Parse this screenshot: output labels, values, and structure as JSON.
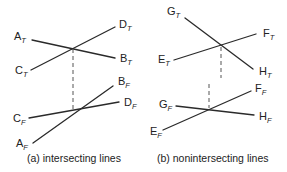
{
  "panels": [
    {
      "id": "a",
      "caption": "(a) intersecting lines",
      "top_view": {
        "lines": [
          {
            "from": {
              "name": "A",
              "sub": "T",
              "x": 32,
              "y": 40
            },
            "to": {
              "name": "B",
              "sub": "T",
              "x": 115,
              "y": 58
            }
          },
          {
            "from": {
              "name": "C",
              "sub": "T",
              "x": 31,
              "y": 70
            },
            "to": {
              "name": "D",
              "sub": "T",
              "x": 115,
              "y": 27
            }
          }
        ],
        "intersection": {
          "x": 73,
          "y": 48
        }
      },
      "front_view": {
        "lines": [
          {
            "from": {
              "name": "A",
              "sub": "F",
              "x": 33,
              "y": 143
            },
            "to": {
              "name": "B",
              "sub": "F",
              "x": 113,
              "y": 86
            }
          },
          {
            "from": {
              "name": "C",
              "sub": "F",
              "x": 29,
              "y": 118
            },
            "to": {
              "name": "D",
              "sub": "F",
              "x": 119,
              "y": 102
            }
          }
        ],
        "intersection": {
          "x": 73,
          "y": 110
        }
      },
      "projection_lines": [
        {
          "x1": 73,
          "y1": 49,
          "x2": 73,
          "y2": 109
        }
      ]
    },
    {
      "id": "b",
      "caption": "(b) nonintersecting lines",
      "top_view": {
        "lines": [
          {
            "from": {
              "name": "G",
              "sub": "T",
              "x": 185,
              "y": 18
            },
            "to": {
              "name": "H",
              "sub": "T",
              "x": 253,
              "y": 69
            }
          },
          {
            "from": {
              "name": "E",
              "sub": "T",
              "x": 174,
              "y": 60
            },
            "to": {
              "name": "F",
              "sub": "T",
              "x": 256,
              "y": 34
            }
          }
        ],
        "crossing": {
          "x": 221,
          "y": 46
        }
      },
      "front_view": {
        "lines": [
          {
            "from": {
              "name": "G",
              "sub": "F",
              "x": 176,
              "y": 106
            },
            "to": {
              "name": "H",
              "sub": "F",
              "x": 254,
              "y": 115
            }
          },
          {
            "from": {
              "name": "E",
              "sub": "F",
              "x": 163,
              "y": 130
            },
            "to": {
              "name": "F",
              "sub": "F",
              "x": 251,
              "y": 91
            }
          }
        ],
        "crossing": {
          "x": 210,
          "y": 109
        }
      },
      "projection_lines": [
        {
          "x1": 221,
          "y1": 47,
          "x2": 221,
          "y2": 78
        },
        {
          "x1": 209,
          "y1": 84,
          "x2": 209,
          "y2": 108
        }
      ]
    }
  ],
  "labels": {
    "AT": {
      "main": "A",
      "sub": "T"
    },
    "BT": {
      "main": "B",
      "sub": "T"
    },
    "CT": {
      "main": "C",
      "sub": "T"
    },
    "DT": {
      "main": "D",
      "sub": "T"
    },
    "AF": {
      "main": "A",
      "sub": "F"
    },
    "BF": {
      "main": "B",
      "sub": "F"
    },
    "CF": {
      "main": "C",
      "sub": "F"
    },
    "DF": {
      "main": "D",
      "sub": "F"
    },
    "GT": {
      "main": "G",
      "sub": "T"
    },
    "HT": {
      "main": "H",
      "sub": "T"
    },
    "ET": {
      "main": "E",
      "sub": "T"
    },
    "FT": {
      "main": "F",
      "sub": "T"
    },
    "GF": {
      "main": "G",
      "sub": "F"
    },
    "HF": {
      "main": "H",
      "sub": "F"
    },
    "EF": {
      "main": "E",
      "sub": "F"
    },
    "FF": {
      "main": "F",
      "sub": "F"
    }
  },
  "captions": {
    "a": "(a) intersecting lines",
    "b": "(b) nonintersecting lines"
  }
}
